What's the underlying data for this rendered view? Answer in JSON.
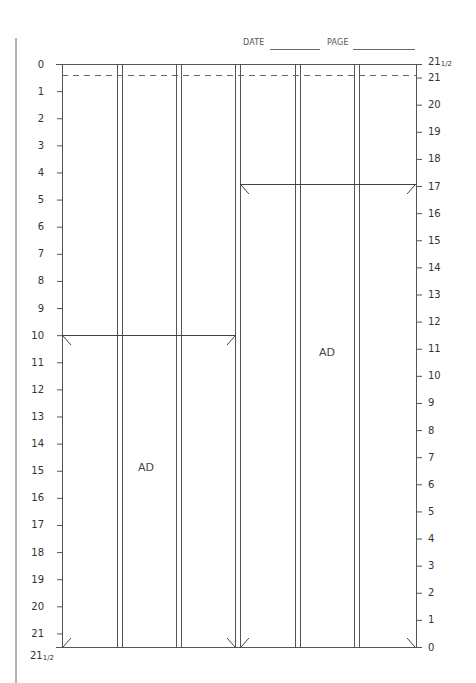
{
  "header": {
    "date_label": "DATE",
    "page_label": "PAGE"
  },
  "columns": {
    "count": 6,
    "left_page_columns": 3,
    "right_page_columns": 3
  },
  "left_scale": {
    "labels": [
      "0",
      "1",
      "2",
      "3",
      "4",
      "5",
      "6",
      "7",
      "8",
      "9",
      "10",
      "11",
      "12",
      "13",
      "14",
      "15",
      "16",
      "17",
      "18",
      "19",
      "20",
      "21"
    ],
    "bottom_label_whole": "21",
    "bottom_label_fraction": "1/2"
  },
  "right_scale": {
    "top_label_whole": "21",
    "top_label_fraction": "1/2",
    "labels": [
      "21",
      "20",
      "19",
      "18",
      "17",
      "16",
      "15",
      "14",
      "13",
      "12",
      "11",
      "10",
      "9",
      "8",
      "7",
      "6",
      "5",
      "4",
      "3",
      "2",
      "1",
      "0"
    ]
  },
  "ads": [
    {
      "label": "AD",
      "page": "left",
      "start_inches": 10,
      "end_inches": 21.5
    },
    {
      "label": "AD",
      "page": "right",
      "start_inches": 17,
      "end_inches": 0
    }
  ],
  "colors": {
    "line": "#555555",
    "text": "#333333"
  }
}
